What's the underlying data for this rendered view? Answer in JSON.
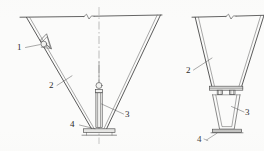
{
  "figure": {
    "type": "engineering-drawing",
    "view_count": 2,
    "stroke_color": "#3a3a3a",
    "background_color": "#fbfbfa",
    "paper_width": 264,
    "paper_height": 151
  },
  "callouts": [
    {
      "id": "1",
      "label": "1",
      "view": "left",
      "x": 17,
      "y": 47,
      "refers_to": "triangular-bracket-with-roller"
    },
    {
      "id": "2",
      "label": "2",
      "view": "left",
      "x": 49,
      "y": 86,
      "refers_to": "inclined-hopper-wall"
    },
    {
      "id": "3",
      "label": "3",
      "view": "left",
      "x": 126,
      "y": 116,
      "refers_to": "vertical-jack-cylinder"
    },
    {
      "id": "4",
      "label": "4",
      "view": "left",
      "x": 71,
      "y": 125,
      "refers_to": "base-plate"
    },
    {
      "id": "2r",
      "label": "2",
      "view": "right",
      "x": 186,
      "y": 71,
      "refers_to": "inclined-hopper-wall"
    },
    {
      "id": "3r",
      "label": "3",
      "view": "right",
      "x": 246,
      "y": 113,
      "refers_to": "trapezoidal-chute-body"
    },
    {
      "id": "4r",
      "label": "4",
      "view": "right",
      "x": 199,
      "y": 141,
      "refers_to": "base-plate"
    }
  ],
  "views": {
    "left": {
      "name": "left-elevation",
      "top_line": {
        "x1": 20,
        "y1": 17,
        "x2": 162,
        "y2": 15
      },
      "centerline": {
        "x": 99,
        "y1": 8,
        "y2": 143
      },
      "break_symbol_x": 88,
      "left_wall": {
        "x1": 26,
        "y1": 17,
        "x2": 92,
        "y2": 130
      },
      "right_wall": {
        "x1": 160,
        "y1": 15,
        "x2": 106,
        "y2": 130
      },
      "jack": {
        "x": 99,
        "top": 88,
        "bottom": 128,
        "width": 7
      },
      "base_plate": {
        "x1": 83,
        "x2": 115,
        "y": 130
      }
    },
    "right": {
      "name": "right-elevation",
      "top_line": {
        "x1": 192,
        "y1": 17,
        "x2": 264,
        "y2": 15
      },
      "break_symbol_x": 232,
      "left_wall": {
        "x1": 195,
        "y1": 17,
        "x2": 212,
        "y2": 88
      },
      "right_wall": {
        "x1": 264,
        "y1": 15,
        "x2": 240,
        "y2": 88
      },
      "collar_band": {
        "x1": 210,
        "y1": 86,
        "x2": 242,
        "y2": 92
      },
      "chute": {
        "top_left": 214,
        "top_right": 239,
        "bottom_left": 220,
        "bottom_right": 233,
        "top_y": 95,
        "bottom_y": 129
      },
      "base_plate": {
        "x1": 213,
        "x2": 241,
        "y": 132
      },
      "fastener_count": 2
    }
  }
}
